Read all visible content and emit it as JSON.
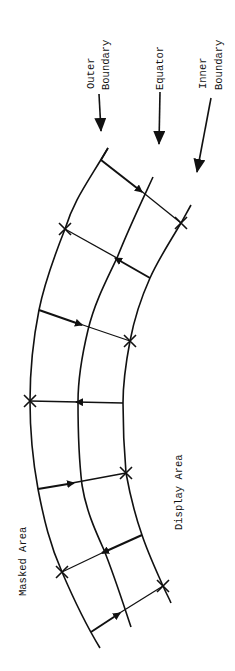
{
  "labels": {
    "outer_1": "Outer",
    "outer_2": "Boundary",
    "equator": "Equator",
    "inner_1": "Inner",
    "inner_2": "Boundary",
    "masked": "Masked Area",
    "display": "Display Area"
  },
  "colors": {
    "line": "#111111",
    "background": "#ffffff"
  }
}
